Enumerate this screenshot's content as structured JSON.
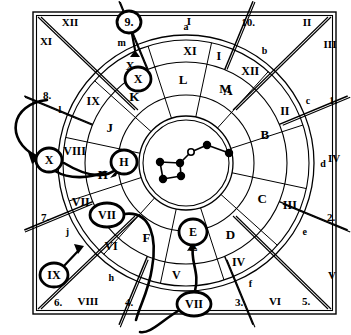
{
  "figure": {
    "background": "#ffffff",
    "ink": "#000000"
  },
  "chart_data": {
    "type": "pie",
    "categories": [
      "I",
      "II",
      "III",
      "IV",
      "V",
      "VI",
      "VII",
      "VIII",
      "IX",
      "X",
      "XI",
      "XII"
    ],
    "values": [
      30,
      30,
      30,
      30,
      30,
      30,
      30,
      30,
      30,
      30,
      30,
      30
    ],
    "xlabel": "",
    "ylabel": "",
    "legend_position": "none",
    "grid": false
  },
  "center": {
    "name": "constellation-ursa-major",
    "stars": [
      {
        "id": "s1",
        "x": 229,
        "y": 153,
        "filled": true
      },
      {
        "id": "s2",
        "x": 207,
        "y": 145,
        "filled": true
      },
      {
        "id": "s3",
        "x": 191,
        "y": 152,
        "filled": false
      },
      {
        "id": "s4",
        "x": 180,
        "y": 163,
        "filled": true
      },
      {
        "id": "s5",
        "x": 181,
        "y": 176,
        "filled": true
      },
      {
        "id": "s6",
        "x": 160,
        "y": 162,
        "filled": true
      },
      {
        "id": "s7",
        "x": 163,
        "y": 179,
        "filled": true
      }
    ],
    "links": [
      [
        "s1",
        "s2"
      ],
      [
        "s2",
        "s3"
      ],
      [
        "s3",
        "s4"
      ],
      [
        "s4",
        "s5"
      ],
      [
        "s5",
        "s7"
      ],
      [
        "s7",
        "s6"
      ],
      [
        "s6",
        "s4"
      ]
    ]
  },
  "rings": {
    "inner_ring_label": "letters-ring",
    "middle_ring_label": "roman-ring",
    "outer_ring_label": "lowercase-ring"
  },
  "letters_ring": [
    {
      "text": "A",
      "angle": -60
    },
    {
      "text": "B",
      "angle": -20
    },
    {
      "text": "C",
      "angle": 25
    },
    {
      "text": "D",
      "angle": 58
    },
    {
      "text": "E",
      "angle": 85
    },
    {
      "text": "F",
      "angle": 118
    },
    {
      "text": "G",
      "angle": 145
    },
    {
      "text": "H",
      "angle": 172
    },
    {
      "text": "J",
      "angle": 205
    },
    {
      "text": "K",
      "angle": 232
    },
    {
      "text": "L",
      "angle": 268
    },
    {
      "text": "M",
      "angle": 298
    }
  ],
  "roman_ring": [
    {
      "text": "I",
      "angle": -73
    },
    {
      "text": "II",
      "angle": -28
    },
    {
      "text": "III",
      "angle": 22
    },
    {
      "text": "IV",
      "angle": 62
    },
    {
      "text": "V",
      "angle": 95
    },
    {
      "text": "VI",
      "angle": 132
    },
    {
      "text": "VII",
      "angle": 160
    },
    {
      "text": "VIII",
      "angle": 186
    },
    {
      "text": "IX",
      "angle": 214
    },
    {
      "text": "X",
      "angle": 240
    },
    {
      "text": "XI",
      "angle": 272
    },
    {
      "text": "XII",
      "angle": 305
    }
  ],
  "lowercase_ring": [
    {
      "text": "a",
      "angle": 270
    },
    {
      "text": "b",
      "angle": 305
    },
    {
      "text": "c",
      "angle": 333
    },
    {
      "text": "d",
      "angle": 0
    },
    {
      "text": "e",
      "angle": 30
    },
    {
      "text": "f",
      "angle": 62
    },
    {
      "text": "g",
      "angle": 90
    },
    {
      "text": "h",
      "angle": 123
    },
    {
      "text": "j",
      "angle": 150
    },
    {
      "text": "k",
      "angle": 180
    },
    {
      "text": "l",
      "angle": 203
    },
    {
      "text": "m",
      "angle": 242
    }
  ],
  "corner_labels": [
    {
      "text": "XII",
      "x": 70,
      "y": 26
    },
    {
      "text": "XI",
      "x": 46,
      "y": 45
    },
    {
      "text": "I",
      "x": 189,
      "y": 25
    },
    {
      "text": "10.",
      "x": 248,
      "y": 26
    },
    {
      "text": "II",
      "x": 307,
      "y": 26
    },
    {
      "text": "III",
      "x": 330,
      "y": 48
    },
    {
      "text": "1.",
      "x": 333,
      "y": 104
    },
    {
      "text": "IV",
      "x": 334,
      "y": 162
    },
    {
      "text": "2.",
      "x": 331,
      "y": 221
    },
    {
      "text": "V",
      "x": 332,
      "y": 279
    },
    {
      "text": "5.",
      "x": 306,
      "y": 305
    },
    {
      "text": "VI",
      "x": 275,
      "y": 305
    },
    {
      "text": "3.",
      "x": 239,
      "y": 306
    },
    {
      "text": "4.",
      "x": 129,
      "y": 306
    },
    {
      "text": "VIII",
      "x": 88,
      "y": 305
    },
    {
      "text": "6.",
      "x": 58,
      "y": 306
    },
    {
      "text": "7.",
      "x": 45,
      "y": 221
    },
    {
      "text": "8.",
      "x": 47,
      "y": 99
    },
    {
      "text": "9.",
      "x": 128,
      "y": 23
    }
  ],
  "callouts": [
    {
      "id": "c9",
      "text": "9.",
      "cx": 129,
      "cy": 22,
      "rx": 12,
      "ry": 11
    },
    {
      "id": "cX1",
      "text": "X",
      "cx": 138,
      "cy": 79,
      "rx": 13,
      "ry": 12
    },
    {
      "id": "cX2",
      "text": "X",
      "cx": 49,
      "cy": 160,
      "rx": 13,
      "ry": 12
    },
    {
      "id": "cH",
      "text": "H",
      "cx": 124,
      "cy": 162,
      "rx": 13,
      "ry": 12
    },
    {
      "id": "cVII1",
      "text": "VII",
      "cx": 107,
      "cy": 215,
      "rx": 17,
      "ry": 12
    },
    {
      "id": "cIX",
      "text": "IX",
      "cx": 54,
      "cy": 275,
      "rx": 14,
      "ry": 12
    },
    {
      "id": "cE",
      "text": "E",
      "cx": 193,
      "cy": 232,
      "rx": 14,
      "ry": 13
    },
    {
      "id": "cVII2",
      "text": "VII",
      "cx": 194,
      "cy": 304,
      "rx": 17,
      "ry": 12
    }
  ],
  "colors": {
    "ink": "#000000",
    "paper": "#ffffff"
  }
}
